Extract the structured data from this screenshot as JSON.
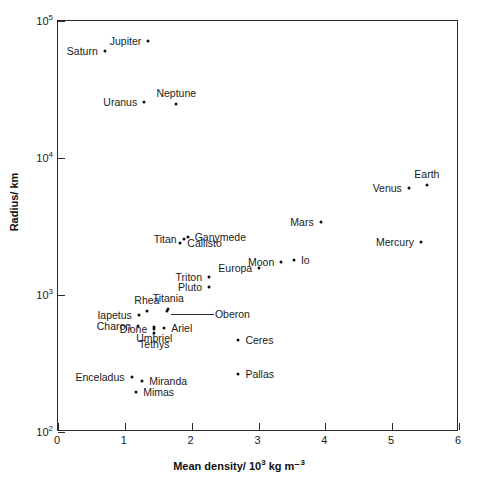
{
  "figure": {
    "background": "#ffffff",
    "frame_color": "#2b2b2b",
    "marker_color": "#111111"
  },
  "chart_data": {
    "type": "scatter",
    "title": "",
    "xlabel": "Mean density/ 10³ kg m⁻³",
    "ylabel": "Radius/ km",
    "xlim": [
      0,
      6
    ],
    "ylim": [
      100,
      100000
    ],
    "yscale": "log",
    "xscale": "linear",
    "grid": false,
    "legend": null,
    "xticks": [
      {
        "value": 0,
        "label": "0"
      },
      {
        "value": 1,
        "label": "1"
      },
      {
        "value": 2,
        "label": "2"
      },
      {
        "value": 3,
        "label": "3"
      },
      {
        "value": 4,
        "label": "4"
      },
      {
        "value": 5,
        "label": "5"
      },
      {
        "value": 6,
        "label": "6"
      }
    ],
    "yticks": [
      {
        "value": 100,
        "label": "10",
        "exponent": "2"
      },
      {
        "value": 1000,
        "label": "10",
        "exponent": "3"
      },
      {
        "value": 10000,
        "label": "10",
        "exponent": "4"
      },
      {
        "value": 100000,
        "label": "10",
        "exponent": "5"
      }
    ],
    "points": [
      {
        "name": "Jupiter",
        "x": 1.35,
        "y": 71400,
        "label_side": "right"
      },
      {
        "name": "Saturn",
        "x": 0.7,
        "y": 60300,
        "label_side": "right"
      },
      {
        "name": "Uranus",
        "x": 1.29,
        "y": 25600,
        "label_side": "right"
      },
      {
        "name": "Neptune",
        "x": 1.77,
        "y": 24800,
        "label_side": "above"
      },
      {
        "name": "Earth",
        "x": 5.52,
        "y": 6378,
        "label_side": "above"
      },
      {
        "name": "Venus",
        "x": 5.25,
        "y": 6052,
        "label_side": "right"
      },
      {
        "name": "Mars",
        "x": 3.93,
        "y": 3397,
        "label_side": "right"
      },
      {
        "name": "Mercury",
        "x": 5.43,
        "y": 2440,
        "label_side": "right"
      },
      {
        "name": "Ganymede",
        "x": 1.94,
        "y": 2631,
        "label_side": "left"
      },
      {
        "name": "Titan",
        "x": 1.88,
        "y": 2575,
        "label_side": "right"
      },
      {
        "name": "Callisto",
        "x": 1.83,
        "y": 2400,
        "label_side": "left"
      },
      {
        "name": "Io",
        "x": 3.53,
        "y": 1815,
        "label_side": "left"
      },
      {
        "name": "Moon",
        "x": 3.34,
        "y": 1738,
        "label_side": "right"
      },
      {
        "name": "Europa",
        "x": 3.01,
        "y": 1569,
        "label_side": "right"
      },
      {
        "name": "Triton",
        "x": 2.26,
        "y": 1353,
        "label_side": "right"
      },
      {
        "name": "Pluto",
        "x": 2.26,
        "y": 1150,
        "label_side": "right"
      },
      {
        "name": "Titania",
        "x": 1.65,
        "y": 789,
        "label_side": "above"
      },
      {
        "name": "Oberon",
        "x": 1.63,
        "y": 761,
        "label_side": "leader"
      },
      {
        "name": "Rhea",
        "x": 1.33,
        "y": 764,
        "label_side": "above"
      },
      {
        "name": "Iapetus",
        "x": 1.21,
        "y": 718,
        "label_side": "right"
      },
      {
        "name": "Umbriel",
        "x": 1.44,
        "y": 585,
        "label_side": "below"
      },
      {
        "name": "Ariel",
        "x": 1.59,
        "y": 579,
        "label_side": "left"
      },
      {
        "name": "Charon",
        "x": 1.2,
        "y": 593,
        "label_side": "right"
      },
      {
        "name": "Dione",
        "x": 1.44,
        "y": 560,
        "label_side": "right"
      },
      {
        "name": "Tethys",
        "x": 1.44,
        "y": 530,
        "label_side": "below"
      },
      {
        "name": "Ceres",
        "x": 2.7,
        "y": 470,
        "label_side": "left"
      },
      {
        "name": "Pallas",
        "x": 2.7,
        "y": 266,
        "label_side": "left"
      },
      {
        "name": "Enceladus",
        "x": 1.1,
        "y": 251,
        "label_side": "right"
      },
      {
        "name": "Miranda",
        "x": 1.26,
        "y": 236,
        "label_side": "left"
      },
      {
        "name": "Mimas",
        "x": 1.17,
        "y": 196,
        "label_side": "left"
      }
    ]
  }
}
